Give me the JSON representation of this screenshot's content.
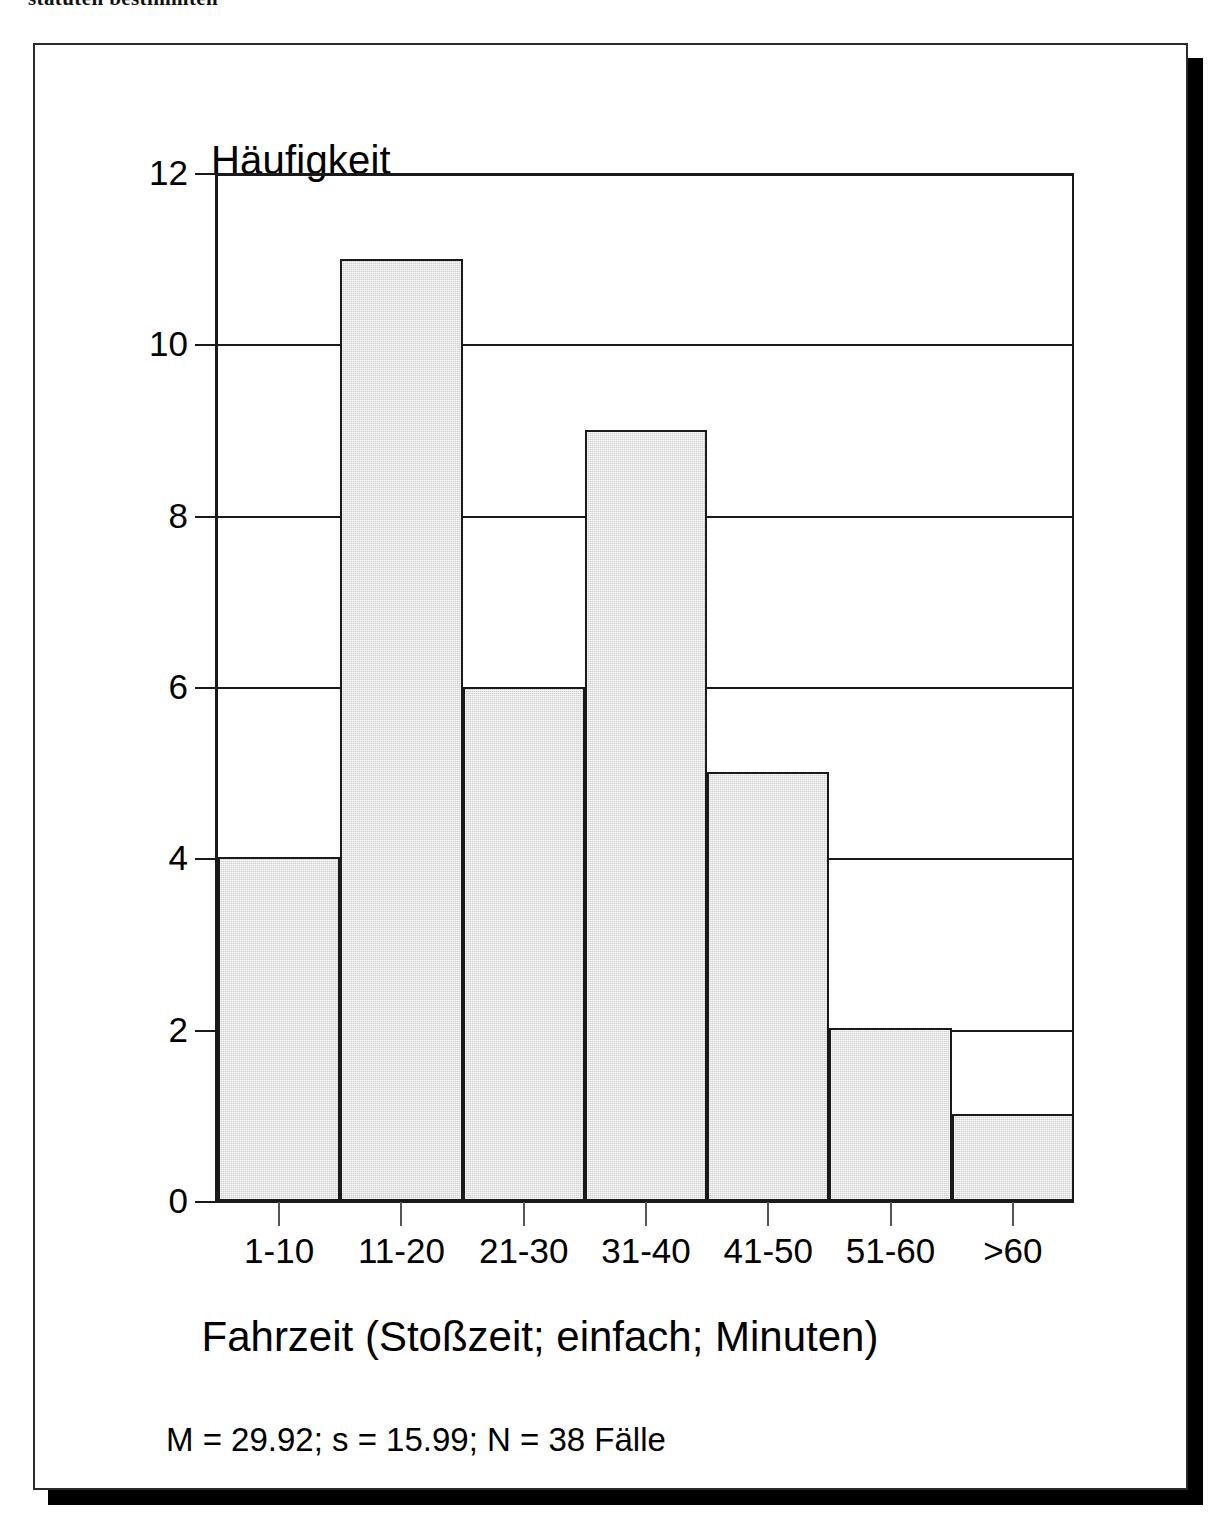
{
  "page": {
    "top_partial_text": "statuten bestimmten"
  },
  "figure": {
    "y_axis_title": "Häufigkeit",
    "x_axis_title": "Fahrzeit (Stoßzeit; einfach; Minuten)",
    "stats_caption": "M = 29.92; s = 15.99; N = 38 Fälle",
    "colors": {
      "bar_fill": "#cfcfcf",
      "bar_outline": "#1a1a1a",
      "axis": "#1a1a1a",
      "background": "#ffffff",
      "shadow": "#000000"
    }
  },
  "chart_data": {
    "type": "bar",
    "title": "",
    "subtitle": "",
    "xlabel": "Fahrzeit (Stoßzeit; einfach; Minuten)",
    "ylabel": "Häufigkeit",
    "categories": [
      "1-10",
      "11-20",
      "21-30",
      "31-40",
      "41-50",
      "51-60",
      ">60"
    ],
    "values": [
      4,
      11,
      6,
      9,
      5,
      2,
      1
    ],
    "ylim": [
      0,
      12
    ],
    "yticks": [
      0,
      2,
      4,
      6,
      8,
      10,
      12
    ],
    "ytick_labels": [
      "0",
      "2",
      "4",
      "6",
      "8",
      "10",
      "12"
    ],
    "grid": true,
    "grid_axis": "y",
    "legend": false,
    "legend_position": "none",
    "annotations": [
      "M = 29.92; s = 15.99; N = 38 Fälle"
    ],
    "bar_gap": 0,
    "orientation": "vertical"
  }
}
